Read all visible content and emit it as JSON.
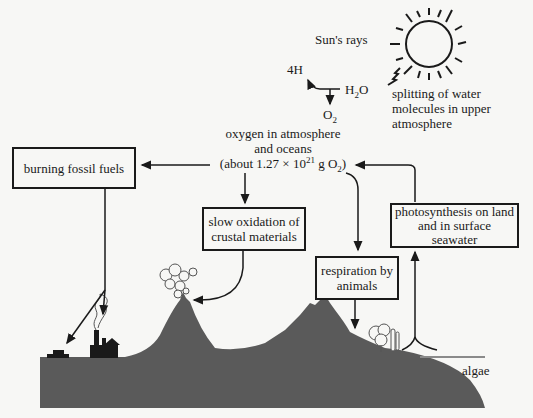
{
  "diagram": {
    "center_reservoir": {
      "line1": "oxygen in atmosphere",
      "line2": "and oceans",
      "line3_prefix": "(about 1.27 × 10",
      "line3_exp": "21",
      "line3_mid": " g O",
      "line3_sub": "2",
      "line3_suffix": ")"
    },
    "sun_label": "Sun's rays",
    "water_split": {
      "reactant_prefix": "H",
      "reactant_sub": "2",
      "reactant_suffix": "O",
      "product_h": "4H",
      "product_o_prefix": "O",
      "product_o_sub": "2"
    },
    "splitting_label": {
      "line1": "splitting of water",
      "line2": "molecules in upper",
      "line3": "atmosphere"
    },
    "boxes": {
      "burning": {
        "line1": "burning fossil fuels"
      },
      "oxidation": {
        "line1": "slow oxidation of",
        "line2": "crustal materials"
      },
      "respiration": {
        "line1": "respiration by",
        "line2": "animals"
      },
      "photosynthesis": {
        "line1": "photosynthesis on land",
        "line2": "and in surface",
        "line3": "seawater"
      }
    },
    "algae_label": "algae",
    "colors": {
      "background": "#f7f7f5",
      "land": "#5a5a5a",
      "ink": "#1a1a1a",
      "water_line": "#8a8a8a"
    }
  }
}
